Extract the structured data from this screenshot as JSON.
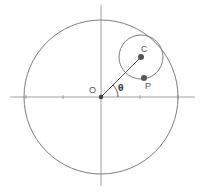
{
  "diagram": {
    "labels": {
      "origin": "O",
      "center": "C",
      "point": "P",
      "angle": "θ"
    },
    "colors": {
      "stroke": "#6e6e6e",
      "axis": "#8a8a8a",
      "point": "#555555",
      "background": "#ffffff"
    },
    "geometry": {
      "origin": [
        101,
        97
      ],
      "large_circle_radius": 77,
      "small_circle_center": [
        141,
        57
      ],
      "small_circle_radius": 22,
      "point_P": [
        144,
        78
      ],
      "x_ticks": [
        26,
        63,
        140,
        178
      ],
      "y_ticks": [
        20,
        58,
        136,
        174
      ]
    }
  }
}
